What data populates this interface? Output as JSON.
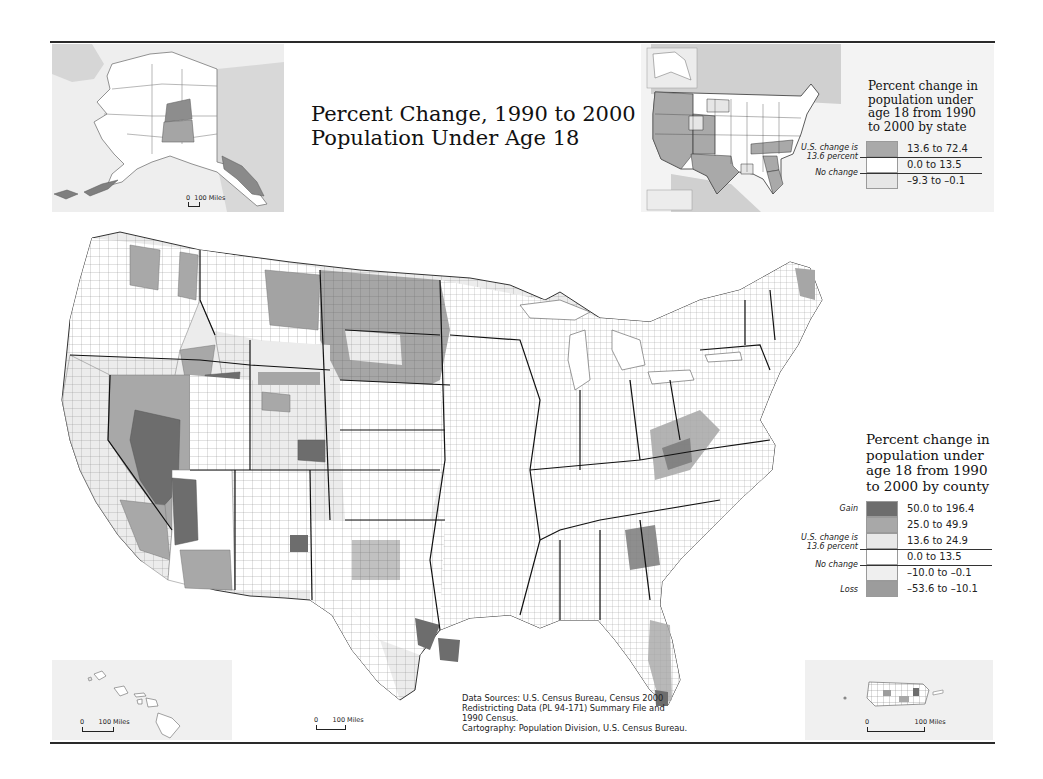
{
  "map": {
    "title_line1": "Percent Change, 1990 to 2000",
    "title_line2": "Population Under Age 18",
    "colors": {
      "frame_rule": "#2a2a2a",
      "inset_background": "#eeeeee",
      "state_boundary": "#1a1a1a",
      "county_boundary": "#8a8a8a"
    }
  },
  "state_legend": {
    "title_lines": [
      "Percent change in",
      "population under",
      "age 18 from 1990",
      "to 2000 by state"
    ],
    "side_labels": {
      "us_change_line1": "U.S. change is",
      "us_change_line2": "13.6 percent",
      "no_change": "No change"
    },
    "classes": [
      {
        "label": "13.6 to 72.4",
        "color": "#a9a9a9"
      },
      {
        "label": "0.0 to 13.5",
        "color": "#ffffff"
      },
      {
        "label": "–9.3 to –0.1",
        "color": "#e6e6e6"
      }
    ]
  },
  "county_legend": {
    "title_lines": [
      "Percent change in",
      "population under",
      "age 18 from 1990",
      "to 2000 by county"
    ],
    "side_labels": {
      "gain": "Gain",
      "us_change_line1": "U.S. change is",
      "us_change_line2": "13.6 percent",
      "no_change": "No change",
      "loss": "Loss"
    },
    "classes": [
      {
        "label": "50.0 to 196.4",
        "color": "#6d6d6d"
      },
      {
        "label": "25.0 to 49.9",
        "color": "#a8a8a8"
      },
      {
        "label": "13.6 to 24.9",
        "color": "#e8e8e8"
      },
      {
        "label": "0.0 to 13.5",
        "color": "#ffffff"
      },
      {
        "label": "–10.0 to –0.1",
        "color": "#efefef"
      },
      {
        "label": "–53.6 to –10.1",
        "color": "#9c9c9c"
      }
    ]
  },
  "insets": {
    "alaska": {
      "scale_zero": "0",
      "scale_label": "100 Miles"
    },
    "hawaii": {
      "scale_zero": "0",
      "scale_label": "100 Miles"
    },
    "conus": {
      "scale_zero": "0",
      "scale_label": "100 Miles"
    },
    "puerto_rico": {
      "scale_zero": "0",
      "scale_label": "100 Miles"
    }
  },
  "credits": {
    "lines": [
      "Data Sources: U.S. Census Bureau, Census 2000",
      "Redistricting Data (PL 94-171) Summary File and",
      "1990 Census.",
      "Cartography: Population Division, U.S. Census Bureau."
    ]
  }
}
